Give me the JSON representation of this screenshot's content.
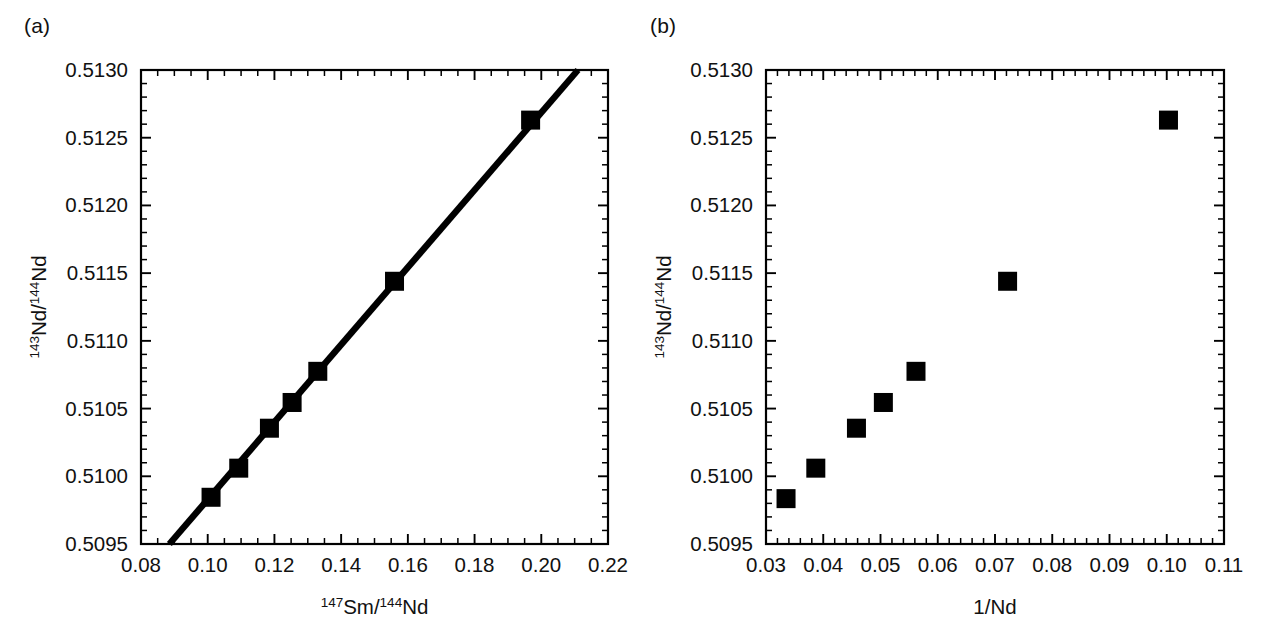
{
  "figure": {
    "panels": [
      {
        "id": "a",
        "label": "(a)",
        "chart_data": {
          "type": "scatter",
          "title": "",
          "xlabel": "147Sm/144Nd",
          "xlabel_parts": {
            "sup1": "147",
            "mid": "Sm/",
            "sup2": "144",
            "tail": "Nd"
          },
          "ylabel": "143Nd/144Nd",
          "ylabel_parts": {
            "sup1": "143",
            "mid": "Nd/",
            "sup2": "144",
            "tail": "Nd"
          },
          "xlim": [
            0.08,
            0.22
          ],
          "ylim": [
            0.5095,
            0.513
          ],
          "xticks": [
            0.08,
            0.1,
            0.12,
            0.14,
            0.16,
            0.18,
            0.2,
            0.22
          ],
          "xtick_labels": [
            "0.08",
            "0.10",
            "0.12",
            "0.14",
            "0.16",
            "0.18",
            "0.20",
            "0.22"
          ],
          "yticks": [
            0.5095,
            0.51,
            0.5105,
            0.511,
            0.5115,
            0.512,
            0.5125,
            0.513
          ],
          "ytick_labels": [
            "0.5095",
            "0.5100",
            "0.5105",
            "0.5110",
            "0.5115",
            "0.5120",
            "0.5125",
            "0.5130"
          ],
          "x_minor_per_major": 4,
          "y_minor_per_major": 5,
          "grid": false,
          "legend": "none",
          "marker": "filled-square",
          "x": [
            0.101,
            0.1093,
            0.1185,
            0.1253,
            0.133,
            0.156,
            0.1968
          ],
          "y": [
            0.509845,
            0.51006,
            0.510355,
            0.510545,
            0.510775,
            0.51144,
            0.51263
          ],
          "isochron_line": {
            "x_start": 0.0885,
            "y_start": 0.5095,
            "x_end": 0.211,
            "y_end": 0.513
          }
        }
      },
      {
        "id": "b",
        "label": "(b)",
        "chart_data": {
          "type": "scatter",
          "title": "",
          "xlabel": "1/Nd",
          "ylabel": "143Nd/144Nd",
          "ylabel_parts": {
            "sup1": "143",
            "mid": "Nd/",
            "sup2": "144",
            "tail": "Nd"
          },
          "xlim": [
            0.03,
            0.11
          ],
          "ylim": [
            0.5095,
            0.513
          ],
          "xticks": [
            0.03,
            0.04,
            0.05,
            0.06,
            0.07,
            0.08,
            0.09,
            0.1,
            0.11
          ],
          "xtick_labels": [
            "0.03",
            "0.04",
            "0.05",
            "0.06",
            "0.07",
            "0.08",
            "0.09",
            "0.10",
            "0.11"
          ],
          "yticks": [
            0.5095,
            0.51,
            0.5105,
            0.511,
            0.5115,
            0.512,
            0.5125,
            0.513
          ],
          "ytick_labels": [
            "0.5095",
            "0.5100",
            "0.5105",
            "0.5110",
            "0.5115",
            "0.5120",
            "0.5125",
            "0.5130"
          ],
          "x_minor_per_major": 5,
          "y_minor_per_major": 5,
          "grid": false,
          "legend": "none",
          "marker": "filled-square",
          "x": [
            0.0335,
            0.0387,
            0.0458,
            0.0505,
            0.0562,
            0.0722,
            0.1003
          ],
          "y": [
            0.509835,
            0.51006,
            0.510355,
            0.510545,
            0.510775,
            0.51144,
            0.51263
          ]
        }
      }
    ],
    "colors": {
      "axis": "#000000",
      "marker": "#000000",
      "line": "#000000",
      "background": "#ffffff"
    }
  }
}
